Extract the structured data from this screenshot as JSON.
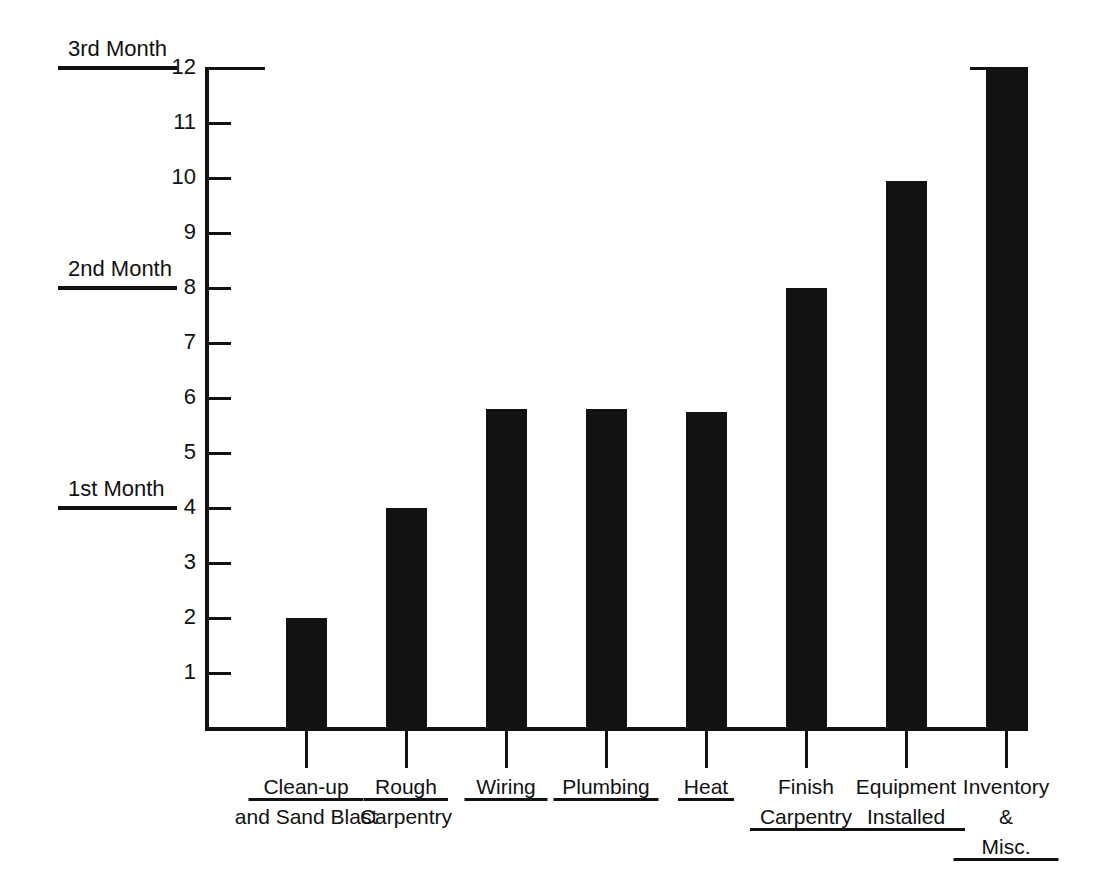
{
  "chart_data": {
    "type": "bar",
    "title": "",
    "subtitle": "",
    "xlabel": "",
    "ylabel": "",
    "ylim": [
      0,
      12
    ],
    "grid": false,
    "legend": "none",
    "orientation": "vertical",
    "bar_color": "#121212",
    "axis_color": "#111111",
    "categories": [
      "Clean-up and Sand Blast",
      "Rough Carpentry",
      "Wiring",
      "Plumbing",
      "Heat",
      "Finish Carpentry",
      "Equipment Installed",
      "Inventory & Misc."
    ],
    "values": [
      2,
      4,
      5.8,
      5.8,
      5.75,
      8,
      9.95,
      12
    ],
    "ytick_labels": [
      "12",
      "11",
      "10",
      "9",
      "8",
      "7",
      "6",
      "5",
      "4",
      "3",
      "2",
      "1"
    ],
    "ytick_values": [
      12,
      11,
      10,
      9,
      8,
      7,
      6,
      5,
      4,
      3,
      2,
      1
    ],
    "annotations": [
      {
        "label": "3rd Month",
        "value": 12
      },
      {
        "label": "2nd Month",
        "value": 8
      },
      {
        "label": "1st Month",
        "value": 4
      }
    ]
  },
  "axis": {
    "y_labels": [
      {
        "text": "12",
        "value": 12
      },
      {
        "text": "11",
        "value": 11
      },
      {
        "text": "10",
        "value": 10
      },
      {
        "text": "9",
        "value": 9
      },
      {
        "text": "8",
        "value": 8
      },
      {
        "text": "7",
        "value": 7
      },
      {
        "text": "6",
        "value": 6
      },
      {
        "text": "5",
        "value": 5
      },
      {
        "text": "4",
        "value": 4
      },
      {
        "text": "3",
        "value": 3
      },
      {
        "text": "2",
        "value": 2
      },
      {
        "text": "1",
        "value": 1
      }
    ]
  },
  "annotations": {
    "third_month": "3rd Month",
    "second_month": "2nd Month",
    "first_month": "1st Month"
  },
  "bars": [
    {
      "name": "clean-up-and-sand-blast",
      "value": 2,
      "lines": [
        "Clean-up",
        "and Sand Blast"
      ],
      "underline_line": 0
    },
    {
      "name": "rough-carpentry",
      "value": 4,
      "lines": [
        "Rough",
        "Carpentry"
      ],
      "underline_line": 0
    },
    {
      "name": "wiring",
      "value": 5.8,
      "lines": [
        "Wiring"
      ],
      "underline_line": 0
    },
    {
      "name": "plumbing",
      "value": 5.8,
      "lines": [
        "Plumbing"
      ],
      "underline_line": 0
    },
    {
      "name": "heat",
      "value": 5.75,
      "lines": [
        "Heat"
      ],
      "underline_line": 0
    },
    {
      "name": "finish-carpentry",
      "value": 8,
      "lines": [
        "Finish",
        "Carpentry"
      ],
      "underline_line": 1
    },
    {
      "name": "equipment-installed",
      "value": 9.95,
      "lines": [
        "Equipment",
        "Installed"
      ],
      "underline_line": 1
    },
    {
      "name": "inventory-and-misc",
      "value": 12,
      "lines": [
        "Inventory",
        "&",
        "Misc."
      ],
      "underline_line": 2
    }
  ]
}
